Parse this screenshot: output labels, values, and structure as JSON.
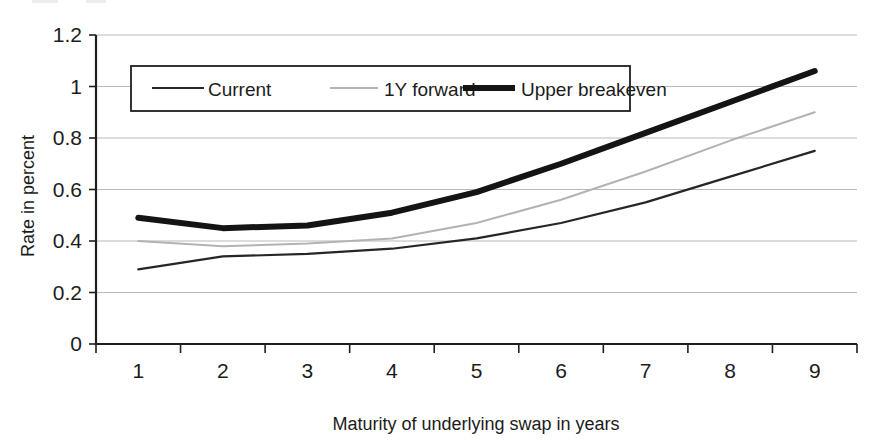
{
  "chart_data": {
    "type": "line",
    "title": "",
    "subtitle": "",
    "xlabel": "Maturity of underlying swap in years",
    "ylabel": "Rate in percent",
    "x": [
      1,
      2,
      3,
      4,
      5,
      6,
      7,
      8,
      9
    ],
    "xtick_labels": [
      "1",
      "2",
      "3",
      "4",
      "5",
      "6",
      "7",
      "8",
      "9"
    ],
    "ytick_labels": [
      "0",
      "0.2",
      "0.4",
      "0.6",
      "0.8",
      "1",
      "1.2"
    ],
    "ytick_values": [
      0,
      0.2,
      0.4,
      0.6,
      0.8,
      1,
      1.2
    ],
    "ylim": [
      0,
      1.2
    ],
    "xlim": [
      0.5,
      9.5
    ],
    "grid": "horizontal",
    "legend_position": "upper-left-inside",
    "series": [
      {
        "name": "Current",
        "values": [
          0.29,
          0.34,
          0.35,
          0.37,
          0.41,
          0.47,
          0.55,
          0.65,
          0.75
        ],
        "color": "#262626",
        "width": 2.2,
        "style": "thin"
      },
      {
        "name": "1Y forward",
        "values": [
          0.4,
          0.38,
          0.39,
          0.41,
          0.47,
          0.56,
          0.67,
          0.79,
          0.9
        ],
        "color": "#b3b3b3",
        "width": 2.0,
        "style": "light"
      },
      {
        "name": "Upper breakeven",
        "values": [
          0.49,
          0.45,
          0.46,
          0.51,
          0.59,
          0.7,
          0.82,
          0.94,
          1.06
        ],
        "color": "#141414",
        "width": 6.0,
        "style": "thick"
      }
    ]
  },
  "axes": {
    "y_title": "Rate in percent",
    "x_title": "Maturity of underlying swap in years"
  },
  "legend": {
    "entries": [
      {
        "label": "Current",
        "color": "#262626",
        "width": 2.2
      },
      {
        "label": "1Y forward",
        "color": "#b3b3b3",
        "width": 2.0
      },
      {
        "label": "Upper breakeven",
        "color": "#141414",
        "width": 6.0
      }
    ]
  }
}
